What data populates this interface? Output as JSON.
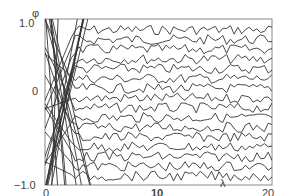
{
  "chart_data": {
    "type": "line",
    "title": "",
    "xlabel": "λ",
    "ylabel": "φ",
    "xlim": [
      0,
      20
    ],
    "ylim": [
      -1.0,
      1.0
    ],
    "x_ticks": [
      "0",
      "10",
      "20"
    ],
    "y_ticks": [
      "1.0",
      "0",
      "−1.0"
    ],
    "grid": false,
    "legend": null,
    "series_count": 16,
    "line_color": "#333333",
    "frame": {
      "left_px": 45,
      "right_px": 272,
      "top_px": 19,
      "bottom_px": 185
    }
  },
  "labels": {
    "y_axis": "φ",
    "y_top": "1.0",
    "y_mid": "0",
    "y_bottom": "−1.0",
    "x_left": "0",
    "x_mid": "10",
    "x_right": "20",
    "x_axis": "λ"
  }
}
